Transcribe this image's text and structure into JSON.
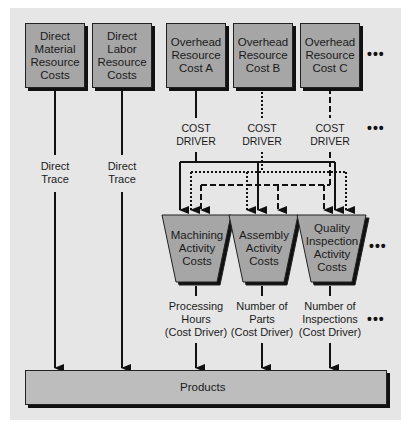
{
  "diagram": {
    "resources": [
      {
        "id": "direct-material",
        "label": "Direct\nMaterial\nResource\nCosts"
      },
      {
        "id": "direct-labor",
        "label": "Direct\nLabor\nResource\nCosts"
      },
      {
        "id": "overhead-a",
        "label": "Overhead\nResource\nCost A"
      },
      {
        "id": "overhead-b",
        "label": "Overhead\nResource\nCost B"
      },
      {
        "id": "overhead-c",
        "label": "Overhead\nResource\nCost C"
      }
    ],
    "direct_trace_label": "Direct\nTrace",
    "cost_driver_label": "COST\nDRIVER",
    "activities": [
      {
        "id": "machining",
        "label": "Machining\nActivity\nCosts",
        "driver": "Processing\nHours\n(Cost Driver)"
      },
      {
        "id": "assembly",
        "label": "Assembly\nActivity\nCosts",
        "driver": "Number of\nParts\n(Cost Driver)"
      },
      {
        "id": "quality-inspection",
        "label": "Quality\nInspection\nActivity\nCosts",
        "driver": "Number of\nInspections\n(Cost Driver)"
      }
    ],
    "products_label": "Products",
    "ellipsis": "•••",
    "line_styles": {
      "overhead_a": "solid",
      "overhead_b": "dotted",
      "overhead_c": "dashed"
    },
    "colors": {
      "box_fill": "#a6a6a6",
      "panel": "#e6e6e6",
      "products_fill": "#bdbdbd",
      "ink": "#111111"
    }
  }
}
